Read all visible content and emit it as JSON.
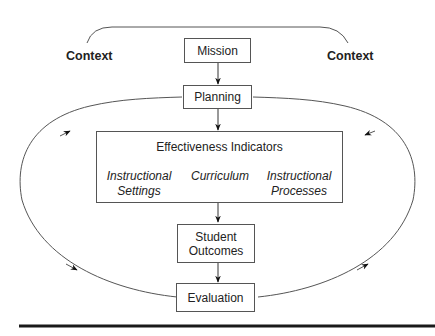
{
  "diagram": {
    "context_left": "Context",
    "context_right": "Context",
    "nodes": {
      "mission": "Mission",
      "planning": "Planning",
      "effectiveness_indicators": {
        "title": "Effectiveness Indicators",
        "items": [
          {
            "line1": "Instructional",
            "line2": "Settings"
          },
          {
            "line1": "Curriculum",
            "line2": ""
          },
          {
            "line1": "Instructional",
            "line2": "Processes"
          }
        ]
      },
      "student_outcomes": {
        "line1": "Student",
        "line2": "Outcomes"
      },
      "evaluation": "Evaluation"
    },
    "edges": [
      {
        "from": "Mission",
        "to": "Planning"
      },
      {
        "from": "Planning",
        "to": "Effectiveness Indicators"
      },
      {
        "from": "Effectiveness Indicators",
        "to": "Student Outcomes"
      },
      {
        "from": "Student Outcomes",
        "to": "Evaluation"
      },
      {
        "from": "Evaluation",
        "to": "Planning",
        "path": "left loop"
      },
      {
        "from": "Evaluation",
        "to": "Planning",
        "path": "right loop"
      }
    ],
    "colors": {
      "line": "#555555",
      "text": "#222222",
      "rule": "#1a1a1a"
    }
  }
}
